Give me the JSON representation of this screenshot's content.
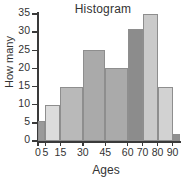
{
  "chart_data": {
    "type": "bar",
    "title": "Histogram",
    "xlabel": "Ages",
    "ylabel": "How many",
    "grid": false,
    "legend": false,
    "ylim": [
      0,
      35
    ],
    "xlim": [
      0,
      95
    ],
    "ytick_labels": [
      "0",
      "5",
      "10",
      "15",
      "20",
      "25",
      "30",
      "35"
    ],
    "ytick_values": [
      0,
      5,
      10,
      15,
      20,
      25,
      30,
      35
    ],
    "xtick_labels": [
      "0",
      "5",
      "15",
      "30",
      "45",
      "60",
      "70",
      "80",
      "90"
    ],
    "xtick_values": [
      0,
      5,
      15,
      30,
      45,
      60,
      70,
      80,
      90
    ],
    "categories": [
      "0-5",
      "5-15",
      "15-30",
      "30-45",
      "45-60",
      "60-70",
      "70-80",
      "80-90",
      "90-95"
    ],
    "values": [
      5.5,
      10,
      15,
      25,
      20,
      31,
      35,
      15,
      2
    ],
    "bins": [
      {
        "label": "0-5",
        "start": 0,
        "end": 5,
        "value": 5.5,
        "color": "#9a9a9a"
      },
      {
        "label": "5-15",
        "start": 5,
        "end": 15,
        "value": 10,
        "color": "#dcdcdc"
      },
      {
        "label": "15-30",
        "start": 15,
        "end": 30,
        "value": 15,
        "color": "#b9b9b9"
      },
      {
        "label": "30-45",
        "start": 30,
        "end": 45,
        "value": 25,
        "color": "#aaaaaa"
      },
      {
        "label": "45-60",
        "start": 45,
        "end": 60,
        "value": 20,
        "color": "#aaaaaa"
      },
      {
        "label": "60-70",
        "start": 60,
        "end": 70,
        "value": 31,
        "color": "#8c8c8c"
      },
      {
        "label": "70-80",
        "start": 70,
        "end": 80,
        "value": 35,
        "color": "#cacaca"
      },
      {
        "label": "80-90",
        "start": 80,
        "end": 90,
        "value": 15,
        "color": "#d2d2d2"
      },
      {
        "label": "90-95",
        "start": 90,
        "end": 95,
        "value": 2,
        "color": "#8f8f8f"
      }
    ]
  }
}
